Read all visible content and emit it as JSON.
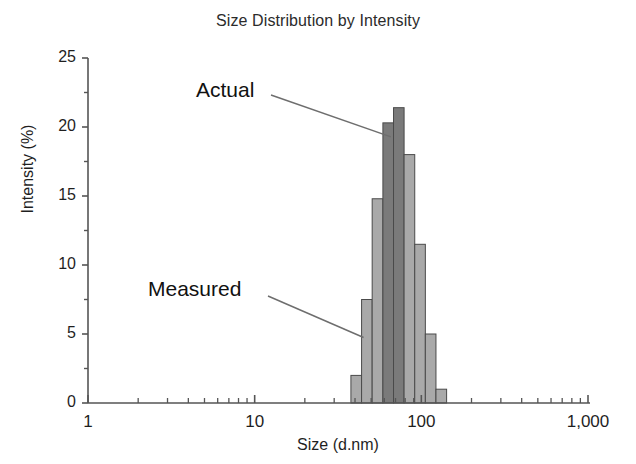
{
  "chart_data": {
    "type": "bar",
    "title": "Size Distribution by Intensity",
    "xlabel": "Size (d.nm)",
    "ylabel": "Intensity (%)",
    "xscale": "log",
    "xlim": [
      1,
      1000
    ],
    "ylim": [
      0,
      25
    ],
    "ytick_labels": [
      "0",
      "5",
      "10",
      "15",
      "20",
      "25"
    ],
    "ytick_values": [
      0,
      5,
      10,
      15,
      20,
      25
    ],
    "yminor_values": [
      2.5,
      7.5,
      12.5,
      17.5,
      22.5
    ],
    "xtick_labels": [
      "1",
      "10",
      "100",
      "1,000"
    ],
    "xtick_values": [
      1,
      10,
      100,
      1000
    ],
    "grid": false,
    "legend": "none",
    "bin_edges_nm": [
      37.8,
      43.8,
      50.7,
      58.8,
      68.1,
      78.8,
      91.3,
      105.7,
      122.4,
      141.8
    ],
    "categories": [
      "37.8",
      "43.8",
      "50.7",
      "58.8",
      "68.1",
      "78.8",
      "91.3",
      "105.7",
      "122.4"
    ],
    "values": [
      2.0,
      7.5,
      14.8,
      20.3,
      21.4,
      18.0,
      11.5,
      5.0,
      1.0
    ],
    "bar_series": [
      "measured",
      "measured",
      "measured",
      "actual",
      "actual",
      "measured",
      "measured",
      "measured",
      "measured"
    ],
    "annotations": [
      {
        "text": "Actual",
        "points_to_nm": 58.8,
        "points_to_value": 20.3
      },
      {
        "text": "Measured",
        "points_to_nm": 43.8,
        "points_to_value": 7.5
      }
    ],
    "colors": {
      "bar_measured_fill": "#a9a9a9",
      "bar_actual_fill": "#7a7a7a",
      "bar_edge": "#4a4a4a",
      "axis": "#555555",
      "text": "#1f1f1f"
    }
  }
}
